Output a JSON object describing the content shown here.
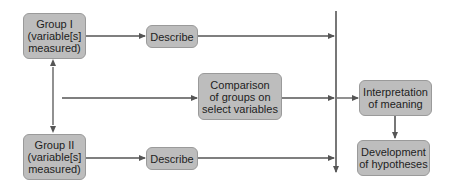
{
  "diagram": {
    "type": "flowchart",
    "colors": {
      "box_fill": "#bdbdbd",
      "box_border": "#9a9a9a",
      "line": "#555555",
      "text": "#1e1e1e"
    },
    "nodes": {
      "group1": {
        "label": "Group I\n(variable[s]\nmeasured)"
      },
      "describe1": {
        "label": "Describe"
      },
      "comparison": {
        "label": "Comparison\nof groups on\nselect variables"
      },
      "group2": {
        "label": "Group II\n(variable[s]\nmeasured)"
      },
      "describe2": {
        "label": "Describe"
      },
      "interpretation": {
        "label": "Interpretation\nof meaning"
      },
      "development": {
        "label": "Development\nof hypotheses"
      }
    },
    "edges": [
      {
        "from": "group1",
        "to": "describe1"
      },
      {
        "from": "describe1",
        "to": "convergence-line"
      },
      {
        "from": "group1",
        "to": "group2",
        "bidirectional": true
      },
      {
        "from": "group1-group2-link",
        "to": "comparison"
      },
      {
        "from": "comparison",
        "to": "convergence-line"
      },
      {
        "from": "convergence-line",
        "to": "interpretation"
      },
      {
        "from": "group2",
        "to": "describe2"
      },
      {
        "from": "describe2",
        "to": "convergence-line"
      },
      {
        "from": "interpretation",
        "to": "development"
      }
    ]
  }
}
